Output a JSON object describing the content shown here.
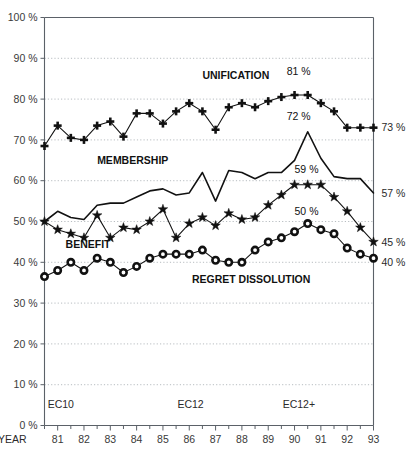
{
  "chart_data": {
    "type": "line",
    "title": "",
    "xlabel": "YEAR",
    "ylabel": "",
    "ylim": [
      0,
      100
    ],
    "xlim": [
      1980.5,
      1993.0
    ],
    "grid": true,
    "legend": "inline-annotations",
    "y_ticks": [
      "0 %",
      "10 %",
      "20 %",
      "30 %",
      "40 %",
      "50 %",
      "60 %",
      "70 %",
      "80 %",
      "90 %",
      "100 %"
    ],
    "y_tick_values": [
      0,
      10,
      20,
      30,
      40,
      50,
      60,
      70,
      80,
      90,
      100
    ],
    "x_tick_labels": [
      "81",
      "82",
      "83",
      "84",
      "85",
      "86",
      "87",
      "88",
      "89",
      "90",
      "91",
      "92",
      "93"
    ],
    "x_tick_values": [
      1981,
      1982,
      1983,
      1984,
      1985,
      1986,
      1987,
      1988,
      1989,
      1990,
      1991,
      1992,
      1993
    ],
    "x_minor_values": [
      1980.5,
      1981.5,
      1982.5,
      1983.5,
      1984.5,
      1985.5,
      1986.5,
      1987.5,
      1988.5,
      1989.5,
      1990.5,
      1991.5,
      1992.5
    ],
    "x": [
      1980.5,
      1981.0,
      1981.5,
      1982.0,
      1982.5,
      1983.0,
      1983.5,
      1984.0,
      1984.5,
      1985.0,
      1985.5,
      1986.0,
      1986.5,
      1987.0,
      1987.5,
      1988.0,
      1988.5,
      1989.0,
      1989.5,
      1990.0,
      1990.5,
      1991.0,
      1991.5,
      1992.0,
      1992.5,
      1993.0
    ],
    "series": [
      {
        "name": "UNIFICATION",
        "marker": "plus",
        "end_value_label": "73 %",
        "peak_value_label": "81 %",
        "values": [
          68.5,
          73.5,
          70.5,
          70.0,
          73.5,
          74.5,
          70.8,
          76.5,
          76.5,
          74.0,
          77.0,
          79.0,
          77.0,
          72.5,
          78.0,
          79.0,
          78.0,
          79.5,
          80.5,
          81.0,
          81.0,
          79.0,
          77.0,
          73.0,
          73.0,
          73.0
        ]
      },
      {
        "name": "MEMBERSHIP",
        "marker": "none",
        "end_value_label": "57 %",
        "peak_value_label": "59 %",
        "values": [
          50.0,
          52.5,
          51.0,
          50.5,
          54.0,
          54.5,
          54.5,
          56.0,
          57.5,
          58.0,
          56.5,
          57.0,
          62.0,
          55.0,
          62.5,
          62.0,
          60.5,
          62.0,
          62.0,
          65.0,
          72.0,
          65.5,
          61.0,
          60.5,
          60.5,
          57.0
        ]
      },
      {
        "name": "BENEFIT",
        "marker": "star",
        "end_value_label": "45 %",
        "peak_value_label": "50 %",
        "values": [
          50.0,
          48.0,
          47.0,
          46.0,
          51.5,
          46.0,
          48.5,
          48.0,
          50.0,
          53.0,
          46.0,
          49.5,
          51.0,
          49.0,
          52.0,
          50.5,
          51.0,
          54.0,
          56.5,
          59.0,
          59.0,
          59.0,
          56.0,
          52.5,
          48.5,
          45.0
        ]
      },
      {
        "name": "REGRET DISSOLUTION",
        "marker": "circle",
        "end_value_label": "40 %",
        "peak_value_label": "50 %",
        "values": [
          36.5,
          38.0,
          40.0,
          38.0,
          41.0,
          40.0,
          37.5,
          39.0,
          41.0,
          42.0,
          42.0,
          42.0,
          43.0,
          40.5,
          40.0,
          40.0,
          43.0,
          45.0,
          46.0,
          47.5,
          49.5,
          48.0,
          47.0,
          43.5,
          42.0,
          41.0
        ]
      }
    ],
    "annotations": [
      {
        "id": "ann-unification-peak",
        "text": "81 %",
        "x": 1989.7,
        "y": 86.0
      },
      {
        "id": "ann-unification-mid",
        "text": "72 %",
        "x": 1989.7,
        "y": 75.0
      },
      {
        "id": "ann-membership-mid",
        "text": "59 %",
        "x": 1990.0,
        "y": 62.0
      },
      {
        "id": "ann-benefit-mid",
        "text": "50 %",
        "x": 1990.0,
        "y": 51.5
      }
    ],
    "series_labels": [
      {
        "id": "label-unification",
        "text": "UNIFICATION",
        "x": 1986.5,
        "y": 85.0
      },
      {
        "id": "label-membership",
        "text": "MEMBERSHIP",
        "x": 1982.5,
        "y": 64.0
      },
      {
        "id": "label-benefit",
        "text": "BENEFIT",
        "x": 1981.3,
        "y": 43.5
      },
      {
        "id": "label-regret",
        "text": "REGRET DISSOLUTION",
        "x": 1986.1,
        "y": 35.0
      }
    ],
    "right_labels": [
      {
        "id": "right-label-unification",
        "text": "73 %",
        "y": 73.0
      },
      {
        "id": "right-label-membership",
        "text": "57 %",
        "y": 57.0
      },
      {
        "id": "right-label-benefit",
        "text": "45 %",
        "y": 45.0
      },
      {
        "id": "right-label-regret",
        "text": "40 %",
        "y": 40.0
      }
    ],
    "period_markers": [
      {
        "id": "period-ec10",
        "text": "EC10",
        "x": 1980.62
      },
      {
        "id": "period-ec12",
        "text": "EC12",
        "x": 1985.55
      },
      {
        "id": "period-ec12plus",
        "text": "EC12+",
        "x": 1989.55
      }
    ]
  },
  "axis": {
    "year_axis_title": "YEAR"
  },
  "colors": {
    "ink": "#111111",
    "axis": "#5b6168",
    "grid": "#9aa0a6",
    "background": "#ffffff"
  }
}
